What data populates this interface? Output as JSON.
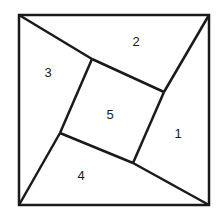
{
  "diagram": {
    "title": "",
    "stroke_color": "#1a1a1a",
    "background": "#ffffff",
    "outer_square": {
      "x1": 19,
      "y1": 15,
      "x2": 209,
      "y2": 205
    },
    "inner_square": [
      [
        92,
        59
      ],
      [
        164,
        92
      ],
      [
        133,
        163
      ],
      [
        60,
        133
      ]
    ],
    "regions": [
      {
        "id": "region-1",
        "label": "1",
        "x": 178,
        "y": 138
      },
      {
        "id": "region-2",
        "label": "2",
        "x": 136,
        "y": 46
      },
      {
        "id": "region-3",
        "label": "3",
        "x": 48,
        "y": 77
      },
      {
        "id": "region-4",
        "label": "4",
        "x": 81,
        "y": 180
      },
      {
        "id": "region-5",
        "label": "5",
        "x": 110,
        "y": 119
      }
    ]
  }
}
